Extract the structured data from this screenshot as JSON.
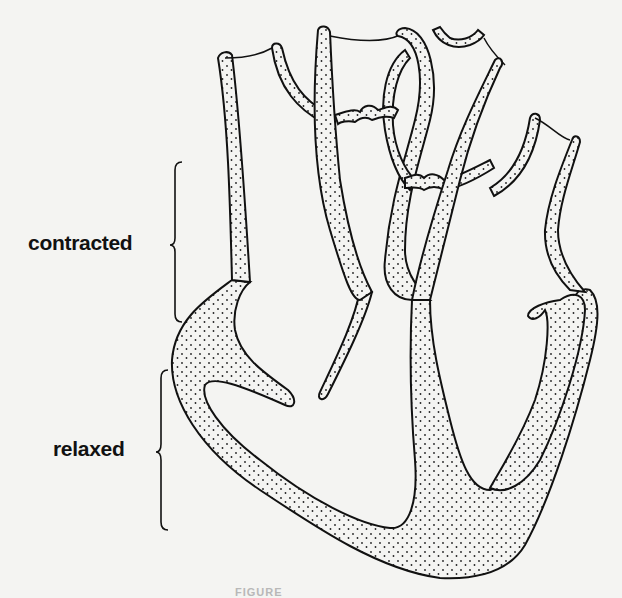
{
  "figure": {
    "labels": {
      "contracted": "contracted",
      "relaxed": "relaxed"
    },
    "brackets": [
      {
        "label_ref": "contracted",
        "y_top": 162,
        "y_bottom": 322
      },
      {
        "label_ref": "relaxed",
        "y_top": 370,
        "y_bottom": 530
      }
    ],
    "caption": "FIGURE",
    "colors": {
      "background": "#f4f4f2",
      "ink": "#111111",
      "stipple_fill": "#eeeeec"
    }
  }
}
